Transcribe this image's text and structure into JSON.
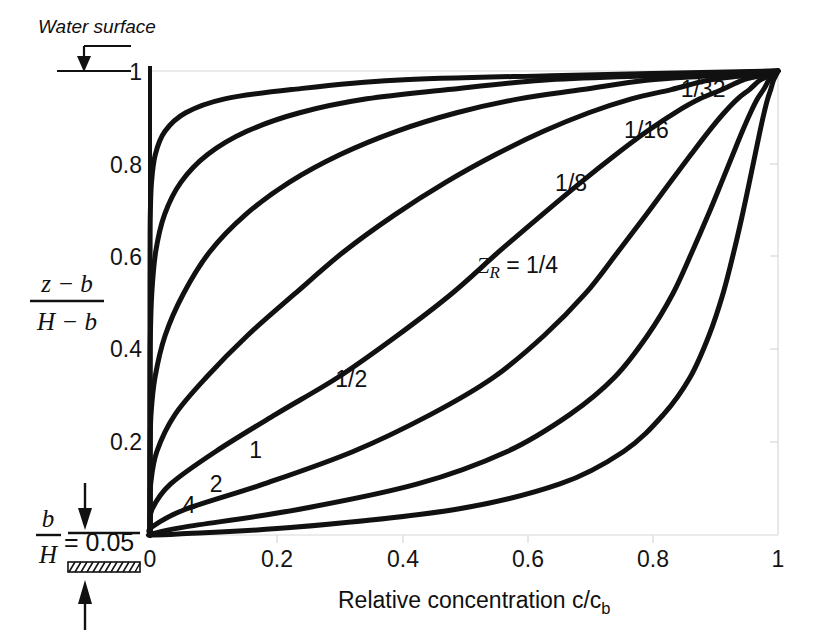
{
  "figure": {
    "background": "#ffffff",
    "ink_color": "#111111",
    "frame_color": "#d8d8d8"
  },
  "annotations": {
    "water_surface": "Water surface",
    "bed_ratio_numerator": "b",
    "bed_ratio_denominator": "H",
    "bed_ratio_equals": "= 0.05"
  },
  "axis_titles": {
    "x": "Relative concentration c/c",
    "x_sub": "b",
    "y_numerator": "z − b",
    "y_denominator": "H − b"
  },
  "chart_data": {
    "type": "line",
    "title": "",
    "xlabel": "Relative concentration c/c_b",
    "ylabel": "(z - b)/(H - b)",
    "xlim": [
      0,
      1
    ],
    "ylim": [
      0,
      1
    ],
    "xticks": [
      0,
      0.2,
      0.4,
      0.6,
      0.8,
      1
    ],
    "xticklabels": [
      "0",
      "0.2",
      "0.4",
      "0.6",
      "0.8",
      "1"
    ],
    "yticks": [
      0,
      0.2,
      0.4,
      0.6,
      0.8,
      1
    ],
    "yticklabels": [
      "",
      "0.2",
      "0.4",
      "0.6",
      "0.8",
      "1"
    ],
    "grid": false,
    "legend": "inline-curve-labels",
    "equation": "c/c_b = [ ((1-y)/y) * (b/(H-b)) ]^Z_R , with b/H = 0.05",
    "parameter_name": "Z_R",
    "b_over_H": 0.05,
    "series": [
      {
        "name": "1/32",
        "z_r": 0.03125,
        "label": "1/32",
        "label_x": 0.845,
        "label_y": 0.945,
        "x": [
          1.0,
          0.9965,
          0.9927,
          0.9884,
          0.9835,
          0.9779,
          0.9713,
          0.9636,
          0.9544,
          0.9433,
          0.9296,
          0.9124,
          0.8901,
          0.8601,
          0.8178,
          0.7542,
          0.6527,
          0.4857,
          0.2332,
          0.0448,
          0.0
        ],
        "y": [
          1.0,
          0.99,
          0.98,
          0.96,
          0.94,
          0.91,
          0.87,
          0.82,
          0.76,
          0.69,
          0.61,
          0.52,
          0.43,
          0.34,
          0.26,
          0.18,
          0.11,
          0.055,
          0.017,
          0.002,
          0.0
        ]
      },
      {
        "name": "1/16",
        "z_r": 0.0625,
        "label": "1/16",
        "label_x": 0.755,
        "label_y": 0.855,
        "x": [
          1.0,
          0.993,
          0.9854,
          0.977,
          0.9673,
          0.9562,
          0.9432,
          0.9281,
          0.9101,
          0.8888,
          0.8631,
          0.8325,
          0.7922,
          0.7398,
          0.6688,
          0.5688,
          0.426,
          0.236,
          0.0544,
          0.002,
          0.0
        ],
        "y": [
          1.0,
          0.99,
          0.98,
          0.96,
          0.94,
          0.91,
          0.87,
          0.82,
          0.76,
          0.69,
          0.61,
          0.52,
          0.43,
          0.34,
          0.26,
          0.18,
          0.11,
          0.055,
          0.017,
          0.002,
          0.0
        ]
      },
      {
        "name": "1/8",
        "z_r": 0.125,
        "label": "1/8",
        "label_x": 0.645,
        "label_y": 0.742,
        "x": [
          1.0,
          0.9861,
          0.9711,
          0.9545,
          0.9357,
          0.9143,
          0.8897,
          0.8614,
          0.8283,
          0.79,
          0.745,
          0.6931,
          0.6276,
          0.5473,
          0.4473,
          0.3235,
          0.1815,
          0.0557,
          0.003,
          0.0,
          0.0
        ],
        "y": [
          1.0,
          0.99,
          0.98,
          0.96,
          0.94,
          0.91,
          0.87,
          0.82,
          0.76,
          0.69,
          0.61,
          0.52,
          0.43,
          0.34,
          0.26,
          0.18,
          0.11,
          0.055,
          0.017,
          0.002,
          0.0
        ]
      },
      {
        "name": "1/4",
        "z_r": 0.25,
        "label": "Z_R = 1/4",
        "label_x": 0.52,
        "label_y": 0.565,
        "x": [
          1.0,
          0.9724,
          0.943,
          0.9111,
          0.8755,
          0.8359,
          0.7915,
          0.7419,
          0.6861,
          0.6241,
          0.5551,
          0.4803,
          0.3939,
          0.2995,
          0.2001,
          0.1046,
          0.0329,
          0.0031,
          0.0,
          0.0,
          0.0
        ],
        "y": [
          1.0,
          0.99,
          0.98,
          0.96,
          0.94,
          0.91,
          0.87,
          0.82,
          0.76,
          0.69,
          0.61,
          0.52,
          0.43,
          0.34,
          0.26,
          0.18,
          0.11,
          0.055,
          0.017,
          0.002,
          0.0
        ]
      },
      {
        "name": "1/2",
        "z_r": 0.5,
        "label": "1/2",
        "label_x": 0.295,
        "label_y": 0.318,
        "x": [
          1.0,
          0.9456,
          0.889,
          0.8301,
          0.7665,
          0.6987,
          0.6265,
          0.5504,
          0.4707,
          0.3895,
          0.3081,
          0.2307,
          0.1552,
          0.0897,
          0.04,
          0.0109,
          0.0011,
          0.0,
          0.0,
          0.0,
          0.0
        ],
        "y": [
          1.0,
          0.99,
          0.98,
          0.96,
          0.94,
          0.91,
          0.87,
          0.82,
          0.76,
          0.69,
          0.61,
          0.52,
          0.43,
          0.34,
          0.26,
          0.18,
          0.11,
          0.055,
          0.017,
          0.002,
          0.0
        ]
      },
      {
        "name": "1",
        "z_r": 1.0,
        "label": "1",
        "label_x": 0.158,
        "label_y": 0.165,
        "x": [
          1.0,
          0.8941,
          0.7903,
          0.6891,
          0.5875,
          0.4882,
          0.3925,
          0.3029,
          0.2216,
          0.1517,
          0.0949,
          0.0532,
          0.0241,
          0.008,
          0.0016,
          0.0001,
          0.0,
          0.0,
          0.0,
          0.0,
          0.0
        ],
        "y": [
          1.0,
          0.99,
          0.98,
          0.96,
          0.94,
          0.91,
          0.87,
          0.82,
          0.76,
          0.69,
          0.61,
          0.52,
          0.43,
          0.34,
          0.26,
          0.18,
          0.11,
          0.055,
          0.017,
          0.002,
          0.0
        ]
      },
      {
        "name": "2",
        "z_r": 2.0,
        "label": "2",
        "label_x": 0.095,
        "label_y": 0.092,
        "x": [
          1.0,
          0.7994,
          0.6246,
          0.4748,
          0.3452,
          0.2383,
          0.1541,
          0.0917,
          0.0491,
          0.023,
          0.009,
          0.0028,
          0.0006,
          0.0001,
          0.0,
          0.0,
          0.0,
          0.0,
          0.0,
          0.0,
          0.0
        ],
        "y": [
          1.0,
          0.99,
          0.98,
          0.96,
          0.94,
          0.91,
          0.87,
          0.82,
          0.76,
          0.69,
          0.61,
          0.52,
          0.43,
          0.34,
          0.26,
          0.18,
          0.11,
          0.055,
          0.017,
          0.002,
          0.0
        ]
      },
      {
        "name": "4",
        "z_r": 4.0,
        "label": "4",
        "label_x": 0.052,
        "label_y": 0.048,
        "x": [
          1.0,
          0.639,
          0.3901,
          0.2254,
          0.1191,
          0.0568,
          0.0238,
          0.0084,
          0.0024,
          0.0005,
          0.0001,
          0.0,
          0.0,
          0.0,
          0.0,
          0.0,
          0.0,
          0.0,
          0.0,
          0.0,
          0.0
        ],
        "y": [
          1.0,
          0.99,
          0.98,
          0.96,
          0.94,
          0.91,
          0.87,
          0.82,
          0.76,
          0.69,
          0.61,
          0.52,
          0.43,
          0.34,
          0.26,
          0.18,
          0.11,
          0.055,
          0.017,
          0.002,
          0.0
        ]
      }
    ]
  }
}
